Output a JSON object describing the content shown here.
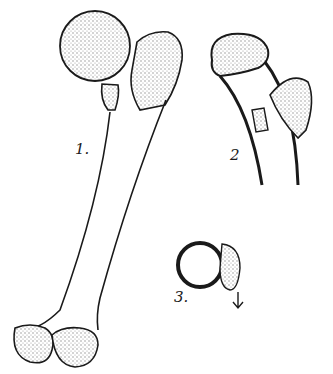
{
  "figure": {
    "labels": [
      {
        "id": "1",
        "text": "1."
      },
      {
        "id": "2",
        "text": "2"
      },
      {
        "id": "3",
        "text": "3."
      }
    ],
    "parts": [
      "femur-full-view",
      "proximal-femur-detail",
      "cross-section-circle"
    ],
    "colors": {
      "ink": "#1a1a1a",
      "stipple": "#9a9a9a",
      "background": "#ffffff"
    }
  }
}
